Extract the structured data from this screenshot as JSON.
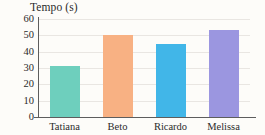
{
  "chart_data": {
    "type": "bar",
    "title": "Tempo (s)",
    "xlabel": "",
    "ylabel": "Tempo (s)",
    "categories": [
      "Tatiana",
      "Beto",
      "Ricardo",
      "Melissa"
    ],
    "values": [
      31,
      50,
      45,
      53
    ],
    "series": [
      {
        "name": "Tempo",
        "values": [
          31,
          50,
          45,
          53
        ]
      }
    ],
    "colors": [
      "#6ECFBD",
      "#F8B183",
      "#41B6E8",
      "#9B96E0"
    ],
    "ylim": [
      0,
      60
    ],
    "ytick_labels": [
      "60",
      "50",
      "40",
      "30",
      "20",
      "10",
      "0"
    ],
    "ytick_values": [
      60,
      50,
      40,
      30,
      20,
      10,
      0
    ],
    "ystep": 10,
    "grid": true,
    "grid_color": "#e9e6e2",
    "legend": false,
    "legend_position": "none",
    "axis_color": "#5d5d5d",
    "background_color": "#fdfcf9",
    "text_color": "#2b2b2b"
  }
}
